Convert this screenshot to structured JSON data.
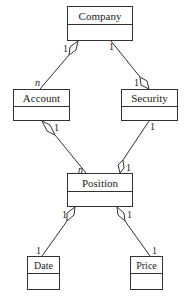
{
  "diagram": {
    "type": "UML class diagram",
    "classes": [
      {
        "id": "company",
        "name": "Company"
      },
      {
        "id": "account",
        "name": "Account"
      },
      {
        "id": "security",
        "name": "Security"
      },
      {
        "id": "position",
        "name": "Position"
      },
      {
        "id": "date",
        "name": "Date"
      },
      {
        "id": "price",
        "name": "Price"
      }
    ],
    "associations": [
      {
        "from": "company",
        "to": "account",
        "kind": "aggregation",
        "diamond_at": "company",
        "from_mult": "1",
        "to_mult": "n"
      },
      {
        "from": "company",
        "to": "security",
        "kind": "aggregation",
        "diamond_at": "security",
        "from_mult": "1",
        "to_mult": "1"
      },
      {
        "from": "account",
        "to": "position",
        "kind": "aggregation",
        "diamond_at": "account",
        "from_mult": "1",
        "to_mult": "n"
      },
      {
        "from": "security",
        "to": "position",
        "kind": "aggregation",
        "diamond_at": "position",
        "from_mult": "1",
        "to_mult": "1"
      },
      {
        "from": "position",
        "to": "date",
        "kind": "aggregation",
        "diamond_at": "position",
        "from_mult": "1",
        "to_mult": "1"
      },
      {
        "from": "position",
        "to": "price",
        "kind": "aggregation",
        "diamond_at": "position",
        "from_mult": "1",
        "to_mult": "1"
      }
    ],
    "multiplicities": {
      "company_account_company": "1",
      "company_account_account": "n",
      "company_security_company": "1",
      "company_security_security": "1",
      "account_position_account": "1",
      "account_position_position": "n",
      "security_position_security": "1",
      "security_position_position": "1",
      "position_date_position": "1",
      "position_date_date": "1",
      "position_price_position": "1",
      "position_price_price": "1"
    },
    "colors": {
      "line": "#333333",
      "background": "#ffffff",
      "text": "#222222"
    }
  }
}
